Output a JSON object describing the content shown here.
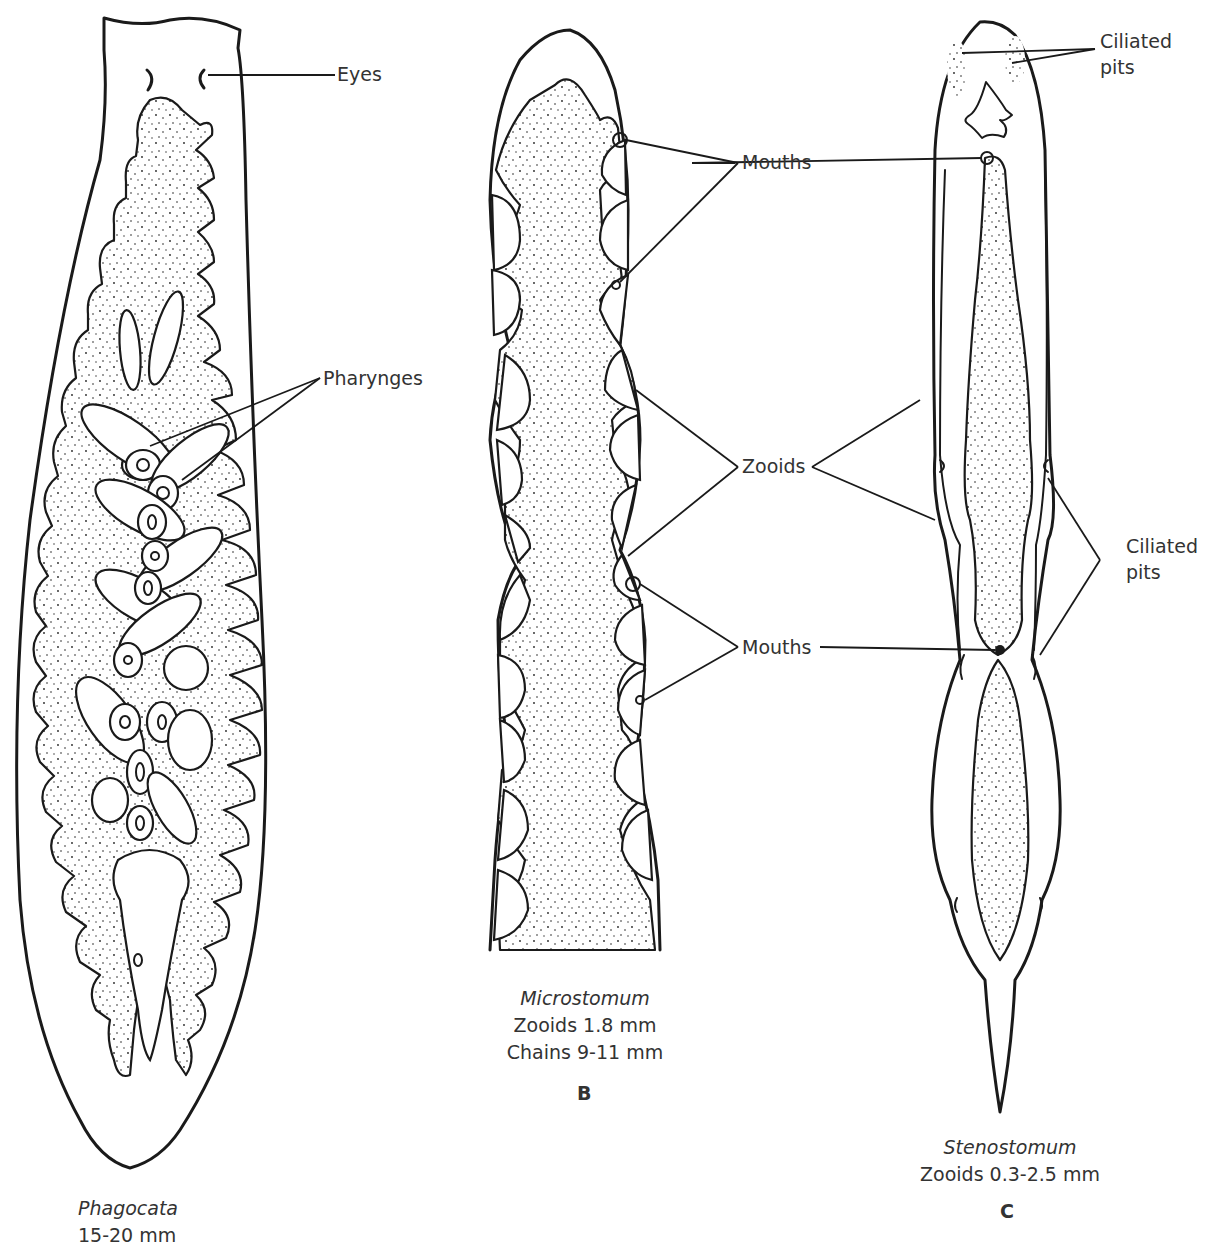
{
  "figure": {
    "panels": [
      {
        "id": "A",
        "genus": "Phagocata",
        "size": "15-20 mm",
        "panel_letter": "",
        "labels": {
          "eyes": "Eyes",
          "pharynges": "Pharynges"
        }
      },
      {
        "id": "B",
        "genus": "Microstomum",
        "size_lines": [
          "Zooids 1.8 mm",
          "Chains 9-11 mm"
        ],
        "panel_letter": "B",
        "labels": {
          "mouths_top": "Mouths",
          "zooids": "Zooids",
          "mouths_bottom": "Mouths"
        }
      },
      {
        "id": "C",
        "genus": "Stenostomum",
        "size": "Zooids 0.3-2.5 mm",
        "panel_letter": "C",
        "labels": {
          "ciliated_pits_top_line1": "Ciliated",
          "ciliated_pits_top_line2": "pits",
          "ciliated_pits_mid_line1": "Ciliated",
          "ciliated_pits_mid_line2": "pits"
        }
      }
    ],
    "line_color": "#1a1a1a",
    "text_color": "#333333",
    "background": "#ffffff"
  }
}
